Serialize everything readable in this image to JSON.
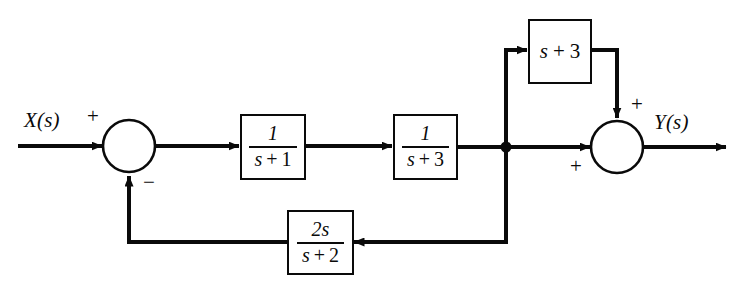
{
  "diagram": {
    "background_color": "#ffffff",
    "line_color": "#0a0a0a",
    "input_signal": "X(s)",
    "output_signal": "Y(s)",
    "blocks": [
      {
        "id": "forward-block-1",
        "type": "fraction",
        "numerator": "1",
        "denominator_var": "s",
        "denominator_op": "+",
        "denominator_const": "3",
        "text": "1/(s + 1)"
      }
    ],
    "forward_block_1": {
      "numerator": "1",
      "den_var": "s",
      "den_op": "+",
      "den_const": "1"
    },
    "forward_block_2": {
      "numerator": "1",
      "den_var": "s",
      "den_op": "+",
      "den_const": "3"
    },
    "feedforward_block": {
      "var": "s",
      "op": "+",
      "const": "3"
    },
    "feedback_block": {
      "numerator": "2s",
      "den_var": "s",
      "den_op": "+",
      "den_const": "2"
    },
    "summing_junction_input": {
      "name": "input-summing-junction",
      "sign_top": "+",
      "sign_bottom": "−"
    },
    "summing_junction_output": {
      "name": "output-summing-junction",
      "sign_top": "+",
      "sign_left": "+"
    }
  }
}
